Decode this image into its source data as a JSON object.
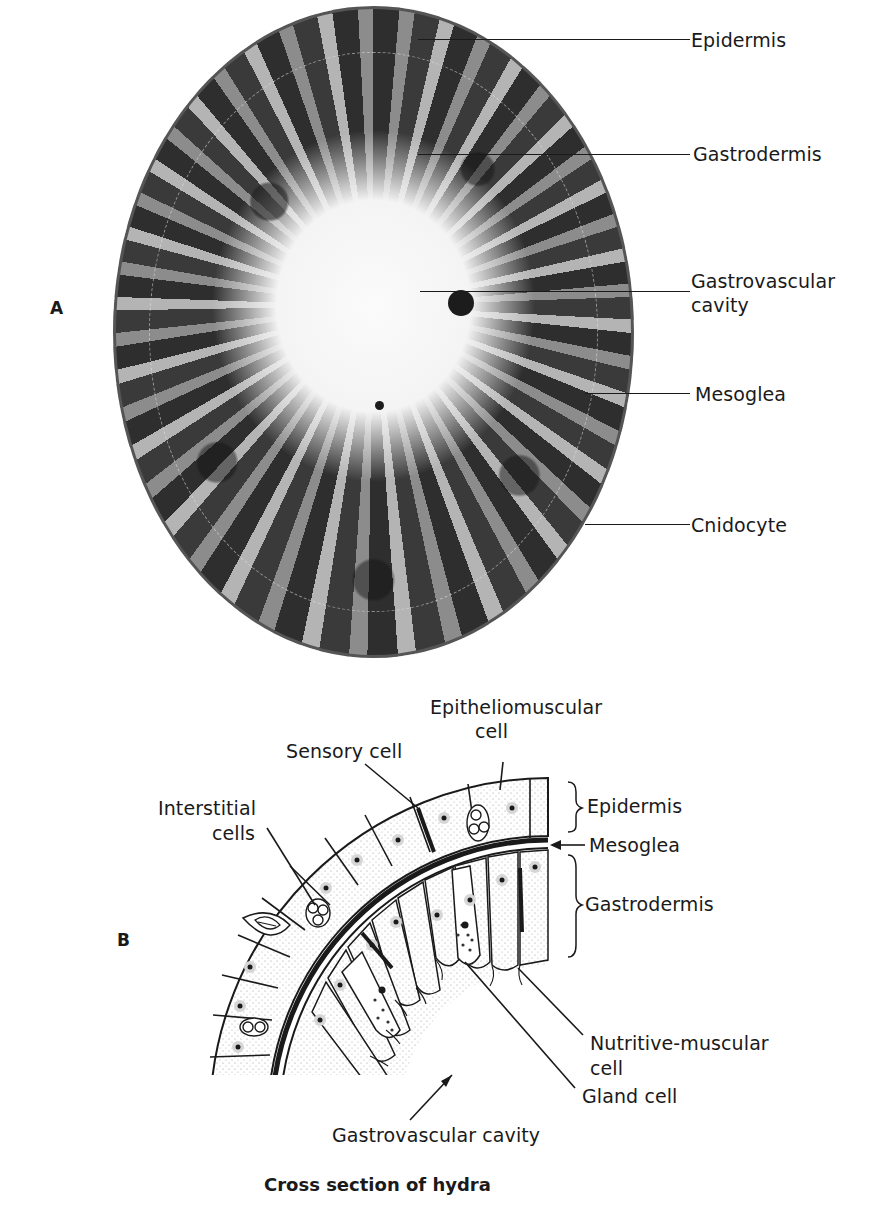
{
  "figure": {
    "caption": "Cross section of hydra",
    "panel_a": {
      "letter": "A",
      "type": "photomicrograph",
      "labels": [
        {
          "text": "Epidermis"
        },
        {
          "text": "Gastrodermis"
        },
        {
          "text_line1": "Gastrovascular",
          "text_line2": "cavity"
        },
        {
          "text": "Mesoglea"
        },
        {
          "text": "Cnidocyte"
        }
      ]
    },
    "panel_b": {
      "letter": "B",
      "type": "line drawing",
      "labels": {
        "epitheliomuscular": {
          "line1": "Epitheliomuscular",
          "line2": "cell"
        },
        "sensory": "Sensory cell",
        "interstitial": {
          "line1": "Interstitial",
          "line2": "cells"
        },
        "epidermis": "Epidermis",
        "mesoglea": "Mesoglea",
        "gastrodermis": "Gastrodermis",
        "nutritive": {
          "line1": "Nutritive-muscular",
          "line2": "cell"
        },
        "gland": "Gland cell",
        "cavity": "Gastrovascular cavity"
      }
    }
  },
  "colors": {
    "ink": "#1a1a1a",
    "background": "#ffffff",
    "stipple": "#9a9a9a"
  }
}
